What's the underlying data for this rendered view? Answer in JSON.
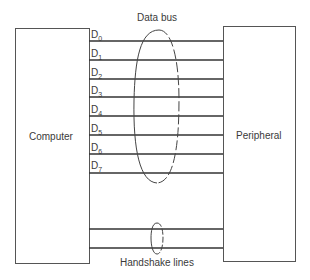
{
  "diagram": {
    "left_device": {
      "label": "Computer"
    },
    "right_device": {
      "label": "Peripheral"
    },
    "data_bus": {
      "label": "Data bus",
      "lines": [
        {
          "name": "D",
          "sub": "0"
        },
        {
          "name": "D",
          "sub": "1"
        },
        {
          "name": "D",
          "sub": "2"
        },
        {
          "name": "D",
          "sub": "3"
        },
        {
          "name": "D",
          "sub": "4"
        },
        {
          "name": "D",
          "sub": "5"
        },
        {
          "name": "D",
          "sub": "6"
        },
        {
          "name": "D",
          "sub": "7"
        }
      ]
    },
    "handshake": {
      "label": "Handshake lines",
      "line_count": 2
    }
  }
}
